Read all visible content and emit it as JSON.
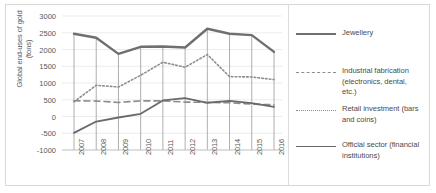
{
  "chart_data": {
    "type": "line",
    "title": "",
    "xlabel": "",
    "ylabel": "Global end-uses of gold (tons)",
    "ylabel_line1": "Global end-uses of gold",
    "ylabel_line2": "(tons)",
    "ylim": [
      -1000,
      3000
    ],
    "ytick_step": 500,
    "yticks": [
      "3000",
      "2500",
      "2000",
      "1500",
      "1000",
      "500",
      "0",
      "-500",
      "-1000"
    ],
    "ytick_values": [
      3000,
      2500,
      2000,
      1500,
      1000,
      500,
      0,
      -500,
      -1000
    ],
    "categories": [
      "2007",
      "2008",
      "2009",
      "2010",
      "2011",
      "2012",
      "2013",
      "2014",
      "2015",
      "2016"
    ],
    "x": [
      2007,
      2008,
      2009,
      2010,
      2011,
      2012,
      2013,
      2014,
      2015,
      2016
    ],
    "grid": true,
    "legend_position": "right",
    "series": [
      {
        "name": "Jewellery",
        "style": "solid-thick",
        "color": "#6f6f71",
        "values": [
          2470,
          2350,
          1870,
          2080,
          2090,
          2060,
          2620,
          2470,
          2430,
          1930
        ]
      },
      {
        "name": "Industrial fabrication (electronics, dental, etc.)",
        "name_line1": "Industrial fabrication",
        "name_line2": "(electronics, dental,",
        "name_line3": "etc.)",
        "style": "dashed",
        "color": "#8d8d8f",
        "values": [
          470,
          460,
          420,
          465,
          465,
          430,
          420,
          410,
          370,
          350
        ]
      },
      {
        "name": "Retail investment (bars and coins)",
        "name_line1": "Retail investment (bars",
        "name_line2": "and coins)",
        "style": "dotted",
        "color": "#8d8d8f",
        "values": [
          440,
          930,
          880,
          1230,
          1620,
          1470,
          1850,
          1190,
          1180,
          1100
        ]
      },
      {
        "name": "Official sector (financial institutions)",
        "name_line1": "Official sector (financial",
        "name_line2": "institutions)",
        "style": "solid-thin",
        "color": "#6a6a6c",
        "values": [
          -490,
          -150,
          -30,
          80,
          480,
          550,
          410,
          465,
          400,
          290
        ]
      }
    ]
  },
  "legend": {
    "items": [
      {
        "label": "Jewellery"
      },
      {
        "label_l1": "Industrial fabrication",
        "label_l2": "(electronics, dental,",
        "label_l3": "etc.)"
      },
      {
        "label_l1": "Retail investment (bars",
        "label_l2": "and coins)"
      },
      {
        "label_l1": "Official sector (financial",
        "label_l2": "institutions)"
      }
    ]
  }
}
